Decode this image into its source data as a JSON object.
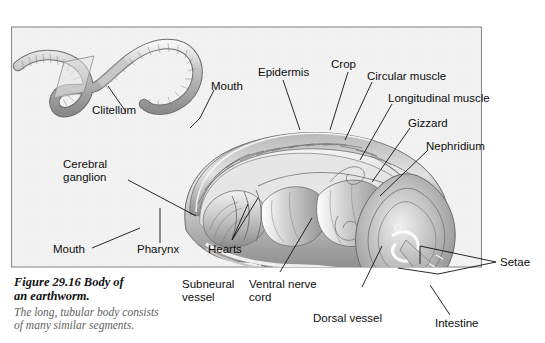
{
  "figure": {
    "caption_heading": "Figure 29.16 Body of\nan earthworm.",
    "caption_body": "The long, tubular body consists\nof many similar segments.",
    "border_color": "#8c8c8c",
    "panel_bg": "#f2f2f2",
    "label_color": "#0d0d0d",
    "leader_color": "#111111"
  },
  "labels": {
    "clitellum": "Clitellum",
    "mouth_top": "Mouth",
    "epidermis": "Epidermis",
    "crop": "Crop",
    "circular_muscle": "Circular muscle",
    "longitudinal_muscle": "Longitudinal muscle",
    "gizzard": "Gizzard",
    "nephridium": "Nephridium",
    "cerebral_ganglion": "Cerebral\nganglion",
    "mouth_bottom": "Mouth",
    "pharynx": "Pharynx",
    "hearts": "Hearts",
    "subneural_vessel": "Subneural\nvessel",
    "ventral_nerve_cord": "Ventral nerve\ncord",
    "dorsal_vessel": "Dorsal vessel",
    "setae": "Setae",
    "intestine": "Intestine"
  }
}
